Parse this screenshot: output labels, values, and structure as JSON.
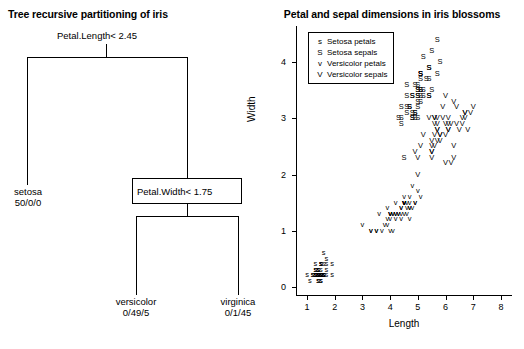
{
  "tree": {
    "title": "Tree recursive partitioning of iris",
    "root_split": "Petal.Length< 2.45",
    "second_split": "Petal.Width< 1.75",
    "leaves": [
      {
        "name": "setosa",
        "counts": "50/0/0"
      },
      {
        "name": "versicolor",
        "counts": "0/49/5"
      },
      {
        "name": "virginica",
        "counts": "0/1/45"
      }
    ]
  },
  "chart_data": {
    "type": "scatter",
    "title": "Petal and sepal dimensions in iris blossoms",
    "xlabel": "Length",
    "ylabel": "Width",
    "xlim": [
      0.6,
      8.4
    ],
    "ylim": [
      -0.15,
      4.65
    ],
    "xticks": [
      1,
      2,
      3,
      4,
      5,
      6,
      7,
      8
    ],
    "yticks": [
      0,
      1,
      2,
      3,
      4
    ],
    "grid": false,
    "legend_position": "top-left",
    "legend": [
      {
        "key": "s",
        "label": "Setosa petals"
      },
      {
        "key": "S",
        "label": "Setosa sepals"
      },
      {
        "key": "v",
        "label": "Versicolor petals"
      },
      {
        "key": "V",
        "label": "Versicolor sepals"
      }
    ],
    "series": [
      {
        "name": "Setosa petals",
        "key": "s",
        "points": [
          [
            1.4,
            0.2
          ],
          [
            1.4,
            0.2
          ],
          [
            1.3,
            0.2
          ],
          [
            1.5,
            0.2
          ],
          [
            1.4,
            0.2
          ],
          [
            1.7,
            0.4
          ],
          [
            1.4,
            0.3
          ],
          [
            1.5,
            0.2
          ],
          [
            1.4,
            0.2
          ],
          [
            1.5,
            0.1
          ],
          [
            1.5,
            0.2
          ],
          [
            1.6,
            0.2
          ],
          [
            1.4,
            0.1
          ],
          [
            1.1,
            0.1
          ],
          [
            1.2,
            0.2
          ],
          [
            1.5,
            0.4
          ],
          [
            1.3,
            0.4
          ],
          [
            1.4,
            0.3
          ],
          [
            1.7,
            0.3
          ],
          [
            1.5,
            0.3
          ],
          [
            1.7,
            0.2
          ],
          [
            1.5,
            0.4
          ],
          [
            1.0,
            0.2
          ],
          [
            1.7,
            0.5
          ],
          [
            1.9,
            0.2
          ],
          [
            1.6,
            0.2
          ],
          [
            1.6,
            0.4
          ],
          [
            1.5,
            0.2
          ],
          [
            1.4,
            0.2
          ],
          [
            1.6,
            0.2
          ],
          [
            1.6,
            0.2
          ],
          [
            1.5,
            0.4
          ],
          [
            1.5,
            0.1
          ],
          [
            1.4,
            0.2
          ],
          [
            1.5,
            0.2
          ],
          [
            1.2,
            0.2
          ],
          [
            1.3,
            0.2
          ],
          [
            1.4,
            0.1
          ],
          [
            1.3,
            0.2
          ],
          [
            1.5,
            0.2
          ],
          [
            1.3,
            0.3
          ],
          [
            1.3,
            0.3
          ],
          [
            1.3,
            0.2
          ],
          [
            1.6,
            0.6
          ],
          [
            1.9,
            0.4
          ],
          [
            1.4,
            0.3
          ],
          [
            1.6,
            0.2
          ],
          [
            1.4,
            0.2
          ],
          [
            1.5,
            0.2
          ],
          [
            1.4,
            0.2
          ]
        ]
      },
      {
        "name": "Setosa sepals",
        "key": "S",
        "points": [
          [
            5.1,
            3.5
          ],
          [
            4.9,
            3.0
          ],
          [
            4.7,
            3.2
          ],
          [
            4.6,
            3.1
          ],
          [
            5.0,
            3.6
          ],
          [
            5.4,
            3.9
          ],
          [
            4.6,
            3.4
          ],
          [
            5.0,
            3.4
          ],
          [
            4.4,
            2.9
          ],
          [
            4.9,
            3.1
          ],
          [
            5.4,
            3.7
          ],
          [
            4.8,
            3.4
          ],
          [
            4.8,
            3.0
          ],
          [
            4.3,
            3.0
          ],
          [
            5.8,
            4.0
          ],
          [
            5.7,
            4.4
          ],
          [
            5.4,
            3.9
          ],
          [
            5.1,
            3.5
          ],
          [
            5.7,
            3.8
          ],
          [
            5.1,
            3.8
          ],
          [
            5.4,
            3.4
          ],
          [
            5.1,
            3.7
          ],
          [
            4.6,
            3.6
          ],
          [
            5.1,
            3.3
          ],
          [
            4.8,
            3.4
          ],
          [
            5.0,
            3.0
          ],
          [
            5.0,
            3.4
          ],
          [
            5.2,
            3.5
          ],
          [
            5.2,
            3.4
          ],
          [
            4.7,
            3.2
          ],
          [
            4.8,
            3.1
          ],
          [
            5.4,
            3.4
          ],
          [
            5.2,
            4.1
          ],
          [
            5.5,
            4.2
          ],
          [
            4.9,
            3.1
          ],
          [
            5.0,
            3.2
          ],
          [
            5.5,
            3.5
          ],
          [
            4.9,
            3.6
          ],
          [
            4.4,
            3.0
          ],
          [
            5.1,
            3.4
          ],
          [
            5.0,
            3.5
          ],
          [
            4.5,
            2.3
          ],
          [
            4.4,
            3.2
          ],
          [
            5.0,
            3.5
          ],
          [
            5.1,
            3.8
          ],
          [
            4.8,
            3.0
          ],
          [
            5.1,
            3.8
          ],
          [
            4.6,
            3.2
          ],
          [
            5.3,
            3.7
          ],
          [
            5.0,
            3.3
          ]
        ]
      },
      {
        "name": "Versicolor petals",
        "key": "v",
        "points": [
          [
            4.7,
            1.4
          ],
          [
            4.5,
            1.5
          ],
          [
            4.9,
            1.5
          ],
          [
            4.0,
            1.3
          ],
          [
            4.6,
            1.5
          ],
          [
            4.5,
            1.3
          ],
          [
            4.7,
            1.6
          ],
          [
            3.3,
            1.0
          ],
          [
            4.6,
            1.3
          ],
          [
            3.9,
            1.4
          ],
          [
            3.5,
            1.0
          ],
          [
            4.2,
            1.5
          ],
          [
            4.0,
            1.0
          ],
          [
            4.7,
            1.4
          ],
          [
            3.6,
            1.3
          ],
          [
            4.4,
            1.4
          ],
          [
            4.5,
            1.5
          ],
          [
            4.1,
            1.0
          ],
          [
            4.5,
            1.5
          ],
          [
            3.9,
            1.1
          ],
          [
            4.8,
            1.8
          ],
          [
            4.0,
            1.3
          ],
          [
            4.9,
            1.5
          ],
          [
            4.7,
            1.2
          ],
          [
            4.3,
            1.3
          ],
          [
            4.4,
            1.4
          ],
          [
            4.8,
            1.4
          ],
          [
            5.0,
            1.7
          ],
          [
            4.5,
            1.5
          ],
          [
            3.5,
            1.0
          ],
          [
            3.8,
            1.1
          ],
          [
            3.7,
            1.0
          ],
          [
            3.9,
            1.2
          ],
          [
            5.1,
            1.6
          ],
          [
            4.5,
            1.5
          ],
          [
            4.5,
            1.6
          ],
          [
            4.7,
            1.5
          ],
          [
            4.4,
            1.3
          ],
          [
            4.1,
            1.3
          ],
          [
            4.0,
            1.3
          ],
          [
            4.4,
            1.2
          ],
          [
            4.6,
            1.4
          ],
          [
            4.0,
            1.2
          ],
          [
            3.3,
            1.0
          ],
          [
            4.2,
            1.3
          ],
          [
            4.2,
            1.2
          ],
          [
            4.2,
            1.3
          ],
          [
            4.3,
            1.3
          ],
          [
            3.0,
            1.1
          ],
          [
            4.1,
            1.3
          ]
        ]
      },
      {
        "name": "Versicolor sepals",
        "key": "V",
        "points": [
          [
            7.0,
            3.2
          ],
          [
            6.4,
            3.2
          ],
          [
            6.9,
            3.1
          ],
          [
            5.5,
            2.3
          ],
          [
            6.5,
            2.8
          ],
          [
            5.7,
            2.8
          ],
          [
            6.3,
            3.3
          ],
          [
            4.9,
            2.4
          ],
          [
            6.6,
            2.9
          ],
          [
            5.2,
            2.7
          ],
          [
            5.0,
            2.0
          ],
          [
            5.9,
            3.0
          ],
          [
            6.0,
            2.2
          ],
          [
            6.1,
            2.9
          ],
          [
            5.6,
            2.9
          ],
          [
            6.7,
            3.1
          ],
          [
            5.6,
            3.0
          ],
          [
            5.8,
            2.7
          ],
          [
            6.2,
            2.2
          ],
          [
            5.6,
            2.5
          ],
          [
            5.9,
            3.2
          ],
          [
            6.1,
            2.8
          ],
          [
            6.3,
            2.5
          ],
          [
            6.1,
            2.8
          ],
          [
            6.4,
            2.9
          ],
          [
            6.6,
            3.0
          ],
          [
            6.8,
            2.8
          ],
          [
            6.7,
            3.0
          ],
          [
            6.0,
            2.9
          ],
          [
            5.7,
            2.6
          ],
          [
            5.5,
            2.4
          ],
          [
            5.5,
            2.4
          ],
          [
            5.8,
            2.7
          ],
          [
            6.0,
            2.7
          ],
          [
            5.4,
            3.0
          ],
          [
            6.0,
            3.4
          ],
          [
            6.7,
            3.1
          ],
          [
            6.3,
            2.3
          ],
          [
            5.6,
            3.0
          ],
          [
            5.5,
            2.5
          ],
          [
            5.5,
            2.6
          ],
          [
            6.1,
            3.0
          ],
          [
            5.8,
            2.6
          ],
          [
            5.0,
            2.3
          ],
          [
            5.6,
            2.7
          ],
          [
            5.7,
            3.0
          ],
          [
            5.7,
            2.9
          ],
          [
            6.2,
            2.9
          ],
          [
            5.1,
            2.5
          ],
          [
            5.7,
            2.8
          ]
        ]
      }
    ]
  }
}
